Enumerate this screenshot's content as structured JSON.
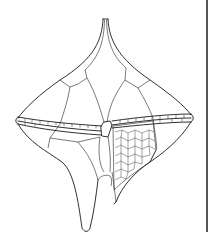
{
  "figure": {
    "colors": {
      "line": "#1a1a1a",
      "background": "#ffffff",
      "frame_edge": "#555555"
    }
  }
}
